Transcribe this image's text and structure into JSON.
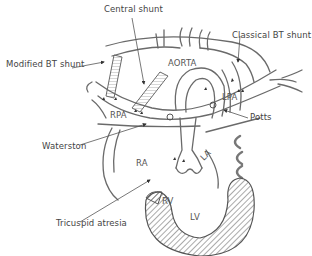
{
  "diagram": {
    "colors": {
      "line": "#6a6a6a",
      "hatch": "#555555",
      "text": "#444444",
      "background": "#ffffff"
    },
    "callouts": {
      "central_shunt": "Central shunt",
      "modified_bt_shunt": "Modified BT shunt",
      "classical_bt_shunt": "Classical BT shunt",
      "potts": "Potts",
      "waterston": "Waterston",
      "tricuspid_atresia": "Tricuspid atresia"
    },
    "structures": {
      "aorta": "AORTA",
      "rpa": "RPA",
      "lpa": "LPA",
      "ra": "RA",
      "la": "LA",
      "rv": "RV",
      "lv": "LV"
    }
  }
}
